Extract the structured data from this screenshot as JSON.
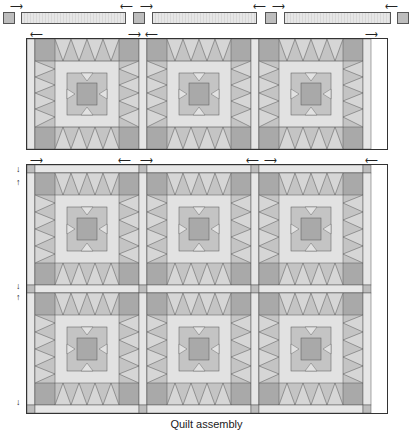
{
  "diagram": {
    "caption": "Quilt assembly",
    "colors": {
      "background": "#ffffff",
      "sashing_light": "#e6e6e6",
      "cornerstone": "#bdbdbd",
      "outline": "#555555",
      "block_dark": "#a9a9a9",
      "block_mid": "#c4c4c4",
      "block_light": "#e2e2e2"
    },
    "top_row_unit": {
      "description": "Sashing row: cornerstone, strip, cornerstone, strip, cornerstone, strip, cornerstone",
      "pieces": [
        "cornerstone",
        "sashing-strip",
        "cornerstone",
        "sashing-strip",
        "cornerstone",
        "sashing-strip",
        "cornerstone"
      ]
    },
    "block_rows": [
      {
        "row": 1,
        "blocks": 3,
        "separated": true
      },
      {
        "row": 2,
        "blocks": 3,
        "separated": false
      },
      {
        "row": 3,
        "blocks": 3,
        "separated": false
      }
    ],
    "block_pattern": "Star block with pointed border rays, light square frame and central star",
    "arrows": {
      "top_row": [
        "right",
        "left",
        "right",
        "left",
        "right",
        "left"
      ],
      "block_row_1": [
        "left",
        "right",
        "left",
        "right"
      ],
      "joined_rows_top": [
        "right",
        "left",
        "right",
        "left",
        "right",
        "left"
      ],
      "left_side_vertical": [
        "down",
        "up",
        "down",
        "up",
        "down"
      ]
    }
  }
}
